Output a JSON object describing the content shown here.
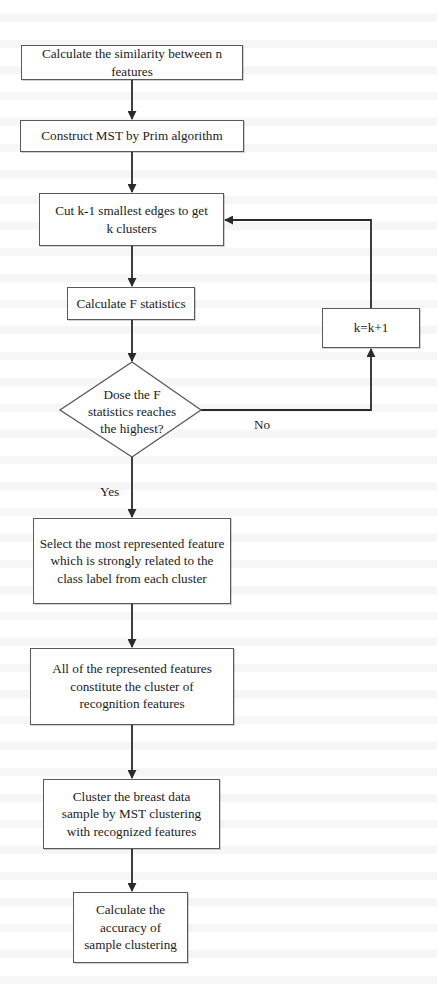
{
  "diagram": {
    "type": "flowchart",
    "colors": {
      "stroke": "#2a2a2a",
      "box_border": "#5a5a5a",
      "background": "#ffffff",
      "text": "#1c1c1c"
    },
    "nodes": [
      {
        "id": "n1",
        "shape": "rect",
        "label": "Calculate the similarity between n features",
        "lines": [
          "Calculate the similarity between n",
          "features"
        ]
      },
      {
        "id": "n2",
        "shape": "rect",
        "label": "Construct MST by Prim algorithm",
        "lines": [
          "Construct MST by Prim algorithm"
        ]
      },
      {
        "id": "n3",
        "shape": "rect",
        "label": "Cut k-1 smallest edges to get k clusters",
        "lines": [
          "Cut k-1 smallest edges to get",
          "k clusters"
        ]
      },
      {
        "id": "n4",
        "shape": "rect",
        "label": "Calculate F statistics",
        "lines": [
          "Calculate F statistics"
        ]
      },
      {
        "id": "n5",
        "shape": "diamond",
        "label": "Dose the F statistics reaches the highest?",
        "lines": [
          "Dose the F",
          "statistics reaches",
          "the highest?"
        ]
      },
      {
        "id": "n6",
        "shape": "rect",
        "label": "k=k+1",
        "lines": [
          "k=k+1"
        ]
      },
      {
        "id": "n7",
        "shape": "rect",
        "label": "Select the most represented feature which is strongly related to the class label from each cluster",
        "lines": [
          "Select the most represented feature",
          "which is strongly related to the",
          "class label from each cluster"
        ]
      },
      {
        "id": "n8",
        "shape": "rect",
        "label": "All of the represented features constitute the cluster of recognition features",
        "lines": [
          "All of the represented features",
          "constitute the cluster of",
          "recognition features"
        ]
      },
      {
        "id": "n9",
        "shape": "rect",
        "label": "Cluster the breast data sample by MST clustering with recognized features",
        "lines": [
          "Cluster the breast data",
          "sample by MST clustering",
          "with recognized features"
        ]
      },
      {
        "id": "n10",
        "shape": "rect",
        "label": "Calculate the accuracy of sample clustering",
        "lines": [
          "Calculate the",
          "accuracy of",
          "sample clustering"
        ]
      }
    ],
    "edges": [
      {
        "from": "n1",
        "to": "n2",
        "label": ""
      },
      {
        "from": "n2",
        "to": "n3",
        "label": ""
      },
      {
        "from": "n3",
        "to": "n4",
        "label": ""
      },
      {
        "from": "n4",
        "to": "n5",
        "label": ""
      },
      {
        "from": "n5",
        "to": "n6",
        "label": "No"
      },
      {
        "from": "n6",
        "to": "n3",
        "label": ""
      },
      {
        "from": "n5",
        "to": "n7",
        "label": "Yes"
      },
      {
        "from": "n7",
        "to": "n8",
        "label": ""
      },
      {
        "from": "n8",
        "to": "n9",
        "label": ""
      },
      {
        "from": "n9",
        "to": "n10",
        "label": ""
      }
    ],
    "edge_labels": {
      "no": "No",
      "yes": "Yes"
    }
  }
}
